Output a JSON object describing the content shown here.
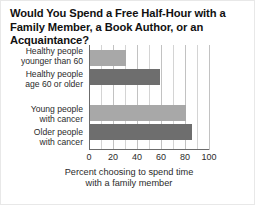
{
  "chart_data": {
    "type": "bar",
    "orientation": "horizontal",
    "title": "Would You Spend a Free Half-Hour with a Family Member, a Book Author, or an Acquaintance?",
    "title_line1": "Would You Spend a Free Half-Hour with a Family",
    "title_line2": "Member, a Book Author, or an Acquaintance?",
    "categories": [
      "Healthy people younger than 60",
      "Healthy people age 60 or older",
      "Young people with cancer",
      "Older people with cancer"
    ],
    "category_lines": [
      [
        "Healthy people",
        "younger than 60"
      ],
      [
        "Healthy people",
        "age 60 or older"
      ],
      [
        "Young people",
        "with cancer"
      ],
      [
        "Older people",
        "with cancer"
      ]
    ],
    "values": [
      31,
      59,
      81,
      86
    ],
    "bar_colors": [
      "#a8a8a8",
      "#6e6e6e",
      "#a8a8a8",
      "#6e6e6e"
    ],
    "xlabel": "Percent choosing to spend time with a family member",
    "xlabel_line1": "Percent choosing to spend time",
    "xlabel_line2": "with a family member",
    "ylabel": "",
    "xlim": [
      0,
      100
    ],
    "xticks": [
      0,
      20,
      40,
      60,
      80,
      100
    ],
    "xtick_labels": [
      "0",
      "20",
      "40",
      "60",
      "80",
      "100"
    ],
    "minor_gridline_step": 10,
    "grid": true,
    "legend": null
  },
  "colors": {
    "light_bar": "#a8a8a8",
    "dark_bar": "#6e6e6e",
    "gridline": "#d4d4d4",
    "axis": "#6b6b6b",
    "text": "#2b2b2b",
    "title": "#111111",
    "background": "#ffffff"
  }
}
